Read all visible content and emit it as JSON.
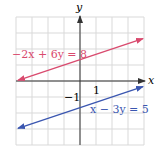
{
  "chart_data": {
    "type": "line",
    "title": "",
    "xlabel": "x",
    "ylabel": "y",
    "xlim": [
      -4,
      4
    ],
    "ylim": [
      -4,
      4
    ],
    "grid": true,
    "tick_labels": {
      "x": [
        "1"
      ],
      "y": [
        "-1"
      ]
    },
    "series": [
      {
        "name": "-2x + 6y = 8",
        "label": "−2x + 6y = 8",
        "color": "#d94a6e",
        "x": [
          -4,
          4
        ],
        "y": [
          0,
          2.667
        ]
      },
      {
        "name": "x - 3y = 5",
        "label": "x − 3y = 5",
        "color": "#3a56b0",
        "x": [
          -4,
          4
        ],
        "y": [
          -3,
          -0.333
        ]
      }
    ]
  },
  "axes": {
    "x_label": "x",
    "y_label": "y",
    "x_tick": "1",
    "y_tick": "−1"
  },
  "labels": {
    "line1": "−2x + 6y = 8",
    "line2": "x − 3y = 5"
  },
  "colors": {
    "line1": "#d94a6e",
    "line2": "#3a56b0",
    "grid": "#d9d9d9",
    "axis": "#333333"
  }
}
